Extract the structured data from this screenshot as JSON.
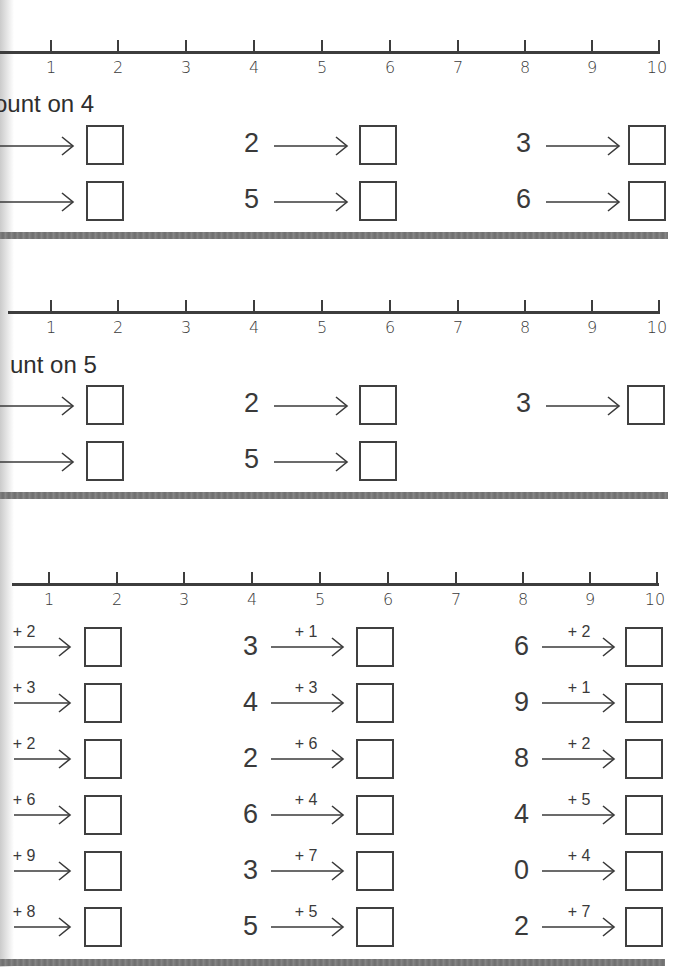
{
  "sections": [
    {
      "id": "count-on-4",
      "heading": "ount on 4",
      "number_line": {
        "labels": [
          "1",
          "2",
          "3",
          "4",
          "5",
          "6",
          "7",
          "8",
          "9",
          "10"
        ]
      },
      "problems": [
        {
          "start": "",
          "op": ""
        },
        {
          "start": "2",
          "op": ""
        },
        {
          "start": "3",
          "op": ""
        },
        {
          "start": "",
          "op": ""
        },
        {
          "start": "5",
          "op": ""
        },
        {
          "start": "6",
          "op": ""
        }
      ]
    },
    {
      "id": "count-on-5",
      "heading": "unt on 5",
      "number_line": {
        "labels": [
          "1",
          "2",
          "3",
          "4",
          "5",
          "6",
          "7",
          "8",
          "9",
          "10"
        ]
      },
      "problems": [
        {
          "start": "",
          "op": ""
        },
        {
          "start": "2",
          "op": ""
        },
        {
          "start": "3",
          "op": ""
        },
        {
          "start": "",
          "op": ""
        },
        {
          "start": "5",
          "op": ""
        }
      ]
    },
    {
      "id": "addition",
      "heading": "",
      "number_line": {
        "labels": [
          "1",
          "2",
          "3",
          "4",
          "5",
          "6",
          "7",
          "8",
          "9",
          "10"
        ]
      },
      "problems": [
        {
          "start": "",
          "op": "+ 2"
        },
        {
          "start": "3",
          "op": "+ 1"
        },
        {
          "start": "6",
          "op": "+ 2"
        },
        {
          "start": "",
          "op": "+ 3"
        },
        {
          "start": "4",
          "op": "+ 3"
        },
        {
          "start": "9",
          "op": "+ 1"
        },
        {
          "start": "",
          "op": "+ 2"
        },
        {
          "start": "2",
          "op": "+ 6"
        },
        {
          "start": "8",
          "op": "+ 2"
        },
        {
          "start": "",
          "op": "+ 6"
        },
        {
          "start": "6",
          "op": "+ 4"
        },
        {
          "start": "4",
          "op": "+ 5"
        },
        {
          "start": "",
          "op": "+ 9"
        },
        {
          "start": "3",
          "op": "+ 7"
        },
        {
          "start": "0",
          "op": "+ 4"
        },
        {
          "start": "",
          "op": "+ 8"
        },
        {
          "start": "5",
          "op": "+ 5"
        },
        {
          "start": "2",
          "op": "+ 7"
        }
      ]
    }
  ],
  "colors": {
    "ink": "#3a3a3a",
    "separator": "#7a7a7a",
    "paper": "#ffffff"
  }
}
